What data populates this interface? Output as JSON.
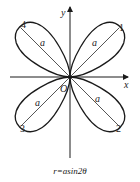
{
  "diagram": {
    "type": "four-leaf rose (polar curve)",
    "equation": "r=asin2θ",
    "axes": {
      "x_label": "x",
      "y_label": "y",
      "origin_label": "O"
    },
    "petals": [
      {
        "id": "1",
        "label": "1",
        "length_label": "a",
        "quadrant": "I"
      },
      {
        "id": "2",
        "label": "2",
        "length_label": "a",
        "quadrant": "IV"
      },
      {
        "id": "3",
        "label": "3",
        "length_label": "a",
        "quadrant": "III"
      },
      {
        "id": "4",
        "label": "4",
        "length_label": "a",
        "quadrant": "II"
      }
    ],
    "colors": {
      "stroke": "#1a1a1a",
      "background": "#ffffff"
    }
  }
}
